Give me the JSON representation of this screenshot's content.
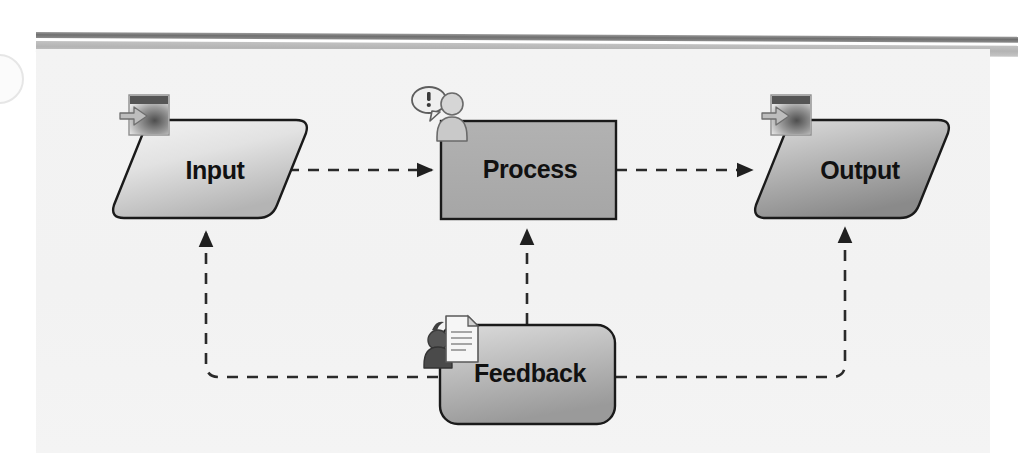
{
  "diagram": {
    "background_color": "#f3f3f3",
    "page_color": "#ffffff",
    "nodes": [
      {
        "id": "input",
        "label": "Input",
        "shape": "rounded-parallelogram",
        "icon": "import-window-arrow-icon",
        "fill_from": "#f2f2f2",
        "fill_to": "#b9b9b9",
        "border_color": "#1a1a1a"
      },
      {
        "id": "process",
        "label": "Process",
        "shape": "rectangle",
        "icon": "person-alert-icon",
        "fill_from": "#b0b0b0",
        "fill_to": "#a8a8a8",
        "border_color": "#1a1a1a"
      },
      {
        "id": "output",
        "label": "Output",
        "shape": "rounded-parallelogram",
        "icon": "export-window-arrow-icon",
        "fill_from": "#d8d8d8",
        "fill_to": "#8f8f8f",
        "border_color": "#1a1a1a"
      },
      {
        "id": "feedback",
        "label": "Feedback",
        "shape": "rounded-rectangle",
        "icon": "person-document-icon",
        "fill_from": "#d6d6d6",
        "fill_to": "#9d9d9d",
        "border_color": "#1a1a1a"
      }
    ],
    "connectors": [
      {
        "id": "input-to-process",
        "from": "input",
        "to": "process",
        "style": "dashed",
        "arrow": true,
        "direction": "right"
      },
      {
        "id": "process-to-output",
        "from": "process",
        "to": "output",
        "style": "dashed",
        "arrow": true,
        "direction": "right"
      },
      {
        "id": "feedback-to-process",
        "from": "feedback",
        "to": "process",
        "style": "dashed",
        "arrow": true,
        "direction": "up"
      },
      {
        "id": "feedback-to-input",
        "from": "feedback",
        "to": "input",
        "style": "dashed",
        "arrow": true,
        "direction": "left-up"
      },
      {
        "id": "output-to-feedback",
        "from": "output",
        "to": "feedback",
        "style": "dashed",
        "arrow": true,
        "direction": "right-up"
      }
    ],
    "line_color": "#2a2a2a",
    "rules": {
      "dark_color": "#7a7a7a",
      "light_color": "#bcbcbc"
    }
  }
}
